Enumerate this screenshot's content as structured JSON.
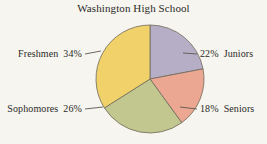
{
  "chart_data": {
    "type": "pie",
    "title": "Washington High School",
    "xlabel": "",
    "ylabel": "",
    "legend_position": "callout-labels",
    "grid": false,
    "categories": [
      "Juniors",
      "Seniors",
      "Sophomores",
      "Freshmen"
    ],
    "values": [
      22,
      18,
      26,
      34
    ],
    "unit": "%",
    "start_angle_deg": 0,
    "direction": "clockwise",
    "slices": [
      {
        "label": "Juniors",
        "value": 22,
        "value_text": "22%",
        "color": "#b6aec6",
        "callout_side": "right",
        "start_deg": 0,
        "end_deg": 79.2
      },
      {
        "label": "Seniors",
        "value": 18,
        "value_text": "18%",
        "color": "#eca792",
        "callout_side": "right",
        "start_deg": 79.2,
        "end_deg": 144.0
      },
      {
        "label": "Sophomores",
        "value": 26,
        "value_text": "26%",
        "color": "#c2c78f",
        "callout_side": "left",
        "start_deg": 144.0,
        "end_deg": 237.6
      },
      {
        "label": "Freshmen",
        "value": 34,
        "value_text": "34%",
        "color": "#f0d16a",
        "callout_side": "left",
        "start_deg": 237.6,
        "end_deg": 360.0
      }
    ]
  },
  "colors": {
    "background": "#f7f5ef",
    "outline": "#6e6a5c",
    "text": "#2a2a28",
    "leader": "#5c5850",
    "juniors": "#b6aec6",
    "seniors": "#eca792",
    "sophomores": "#c2c78f",
    "freshmen": "#f0d16a"
  },
  "labels": {
    "freshmen": {
      "name": "Freshmen",
      "percent": "34%"
    },
    "sophomores": {
      "name": "Sophomores",
      "percent": "26%"
    },
    "juniors": {
      "name": "Juniors",
      "percent": "22%"
    },
    "seniors": {
      "name": "Seniors",
      "percent": "18%"
    }
  }
}
